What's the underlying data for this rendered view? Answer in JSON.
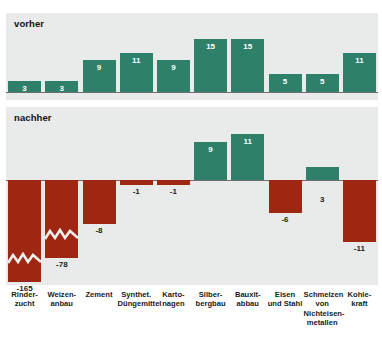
{
  "panels": {
    "top": {
      "title": "vorher"
    },
    "bottom": {
      "title": "nachher"
    }
  },
  "colors": {
    "positive": "#2e8069",
    "negative": "#9e2712",
    "panel_background": "#e9eaea",
    "page_background": "#ffffff",
    "axis": "#6d6f6e",
    "label_dark": "#1b1b1b",
    "label_light": "#ffffff"
  },
  "categories": [
    "Rinder-\nzucht",
    "Weizen-\nanbau",
    "Zement",
    "Synthet.\nDüngemittel",
    "Karto-\nnagen",
    "Silber-\nbergbau",
    "Bauxit-\nabbau",
    "Eisen\nund Stahl",
    "Schmelzen\nvon\nNichteisen-\nmetallen",
    "Kohle-\nkraft"
  ],
  "chart_data": [
    {
      "type": "bar",
      "title": "vorher",
      "categories": [
        "Rinderzucht",
        "Weizenanbau",
        "Zement",
        "Synthet. Düngemittel",
        "Kartonagen",
        "Silberbergbau",
        "Bauxitabbau",
        "Eisen und Stahl",
        "Schmelzen von Nichteisenmetallen",
        "Kohlekraft"
      ],
      "values": [
        3,
        3,
        9,
        11,
        9,
        15,
        15,
        5,
        5,
        11
      ],
      "value_labels": [
        "3",
        "3",
        "9",
        "11",
        "9",
        "15",
        "15",
        "5",
        "5",
        "11"
      ],
      "xlabel": "",
      "ylabel": "",
      "ylim": [
        0,
        17
      ],
      "grid": false,
      "legend": "none"
    },
    {
      "type": "bar",
      "title": "nachher",
      "categories": [
        "Rinderzucht",
        "Weizenanbau",
        "Zement",
        "Synthet. Düngemittel",
        "Kartonagen",
        "Silberbergbau",
        "Bauxitabbau",
        "Eisen und Stahl",
        "Schmelzen von Nichteisenmetallen",
        "Kohlekraft"
      ],
      "values": [
        -165,
        -78,
        -8,
        -1,
        -1,
        9,
        11,
        -6,
        3,
        -11
      ],
      "value_labels": [
        "-165",
        "-78",
        "-8",
        "-1",
        "-1",
        "9",
        "11",
        "-6",
        "3",
        "-11"
      ],
      "axis_break": {
        "applies_to": [
          "Rinderzucht",
          "Weizenanbau"
        ],
        "note": "zigzag break marks on the two longest negative bars"
      },
      "xlabel": "",
      "ylabel": "",
      "ylim": [
        -14,
        12
      ],
      "grid": false,
      "legend": "none"
    }
  ]
}
